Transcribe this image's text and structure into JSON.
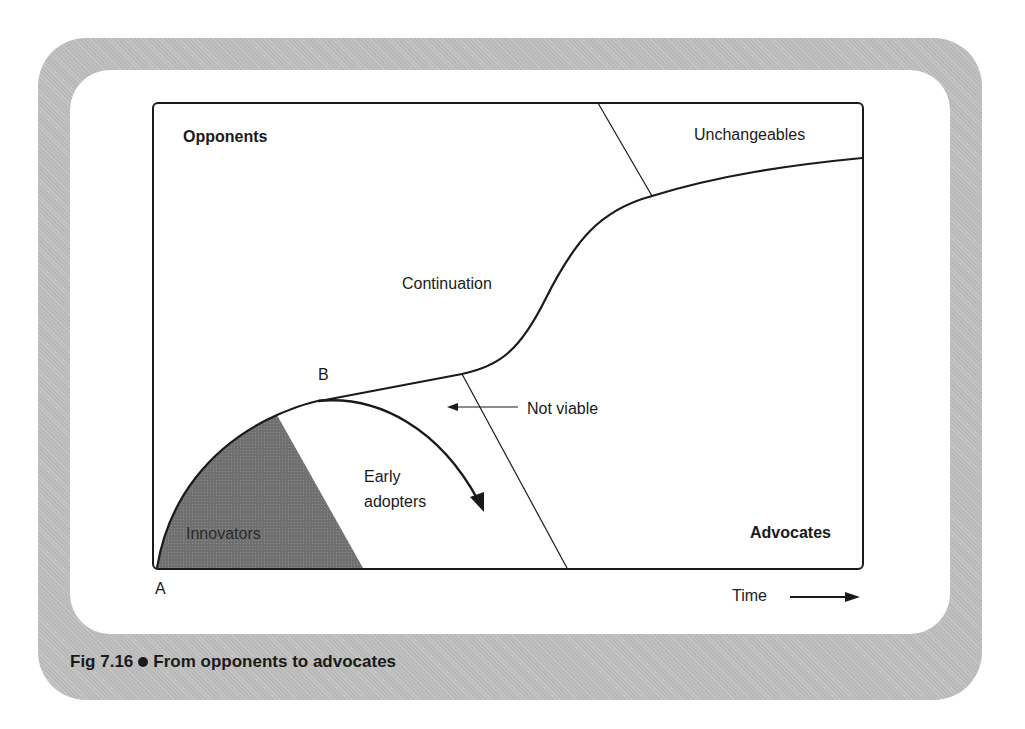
{
  "figure": {
    "number": "Fig 7.16",
    "title": "From opponents to advocates"
  },
  "regions": {
    "opponents": "Opponents",
    "unchangeables": "Unchangeables",
    "continuation": "Continuation",
    "not_viable": "Not viable",
    "early_adopters_line1": "Early",
    "early_adopters_line2": "adopters",
    "innovators": "Innovators",
    "advocates": "Advocates"
  },
  "points": {
    "a": "A",
    "b": "B"
  },
  "axis": {
    "x_label": "Time"
  },
  "colors": {
    "frame": "#b9b9b9",
    "innovators_fill": "#6e6e6e",
    "line": "#1a1a1a"
  }
}
